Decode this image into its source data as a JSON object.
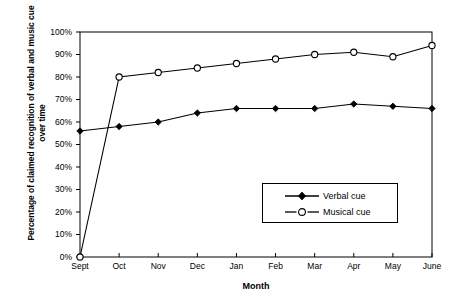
{
  "chart_data": {
    "type": "line",
    "title": "",
    "xlabel": "Month",
    "ylabel": "Percentage of claimed recognition of verbal and music cue over time",
    "categories": [
      "Sept",
      "Oct",
      "Nov",
      "Dec",
      "Jan",
      "Feb",
      "Mar",
      "Apr",
      "May",
      "June"
    ],
    "ylim": [
      0,
      100
    ],
    "ytick_labels": [
      "0%",
      "10%",
      "20%",
      "30%",
      "40%",
      "50%",
      "60%",
      "70%",
      "80%",
      "90%",
      "100%"
    ],
    "ytick_values": [
      0,
      10,
      20,
      30,
      40,
      50,
      60,
      70,
      80,
      90,
      100
    ],
    "grid": false,
    "legend_position": "inside-lower-right",
    "series": [
      {
        "name": "Verbal cue",
        "marker": "filled-diamond",
        "color": "#000000",
        "values": [
          56,
          58,
          60,
          64,
          66,
          66,
          66,
          68,
          67,
          66
        ]
      },
      {
        "name": "Musical cue",
        "marker": "open-circle",
        "color": "#000000",
        "values": [
          0,
          80,
          82,
          84,
          86,
          88,
          90,
          91,
          89,
          94
        ]
      }
    ]
  },
  "legend": {
    "items": [
      {
        "label": "Verbal cue"
      },
      {
        "label": "Musical cue"
      }
    ]
  }
}
